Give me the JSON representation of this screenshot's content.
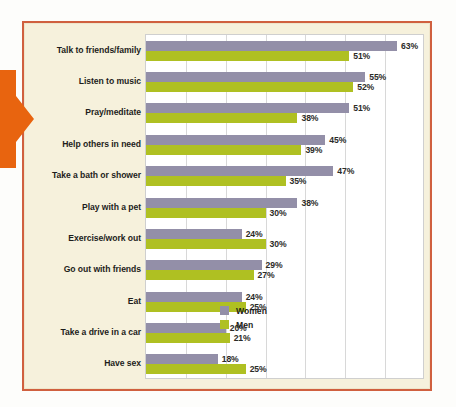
{
  "colors": {
    "women": "#938fa8",
    "men": "#afc022",
    "frame_border": "#d0603f",
    "card_background": "#f6f1dc",
    "plot_background": "#ffffff",
    "gridline": "#d8d8d8",
    "arrow": "#e8640f",
    "label_text": "#1d1d1b"
  },
  "legend": {
    "items": [
      {
        "label": "Women",
        "color": "#938fa8"
      },
      {
        "label": "Men",
        "color": "#afc022"
      }
    ]
  },
  "chart_data": {
    "type": "bar",
    "orientation": "horizontal",
    "title": "",
    "xlabel": "",
    "ylabel": "",
    "xlim": [
      0,
      70
    ],
    "xticks": [
      0,
      10,
      20,
      30,
      40,
      50,
      60,
      70
    ],
    "grid": true,
    "legend_position": "inside-right-lower",
    "value_suffix": "%",
    "categories": [
      "Talk to friends/family",
      "Listen to music",
      "Pray/meditate",
      "Help others in need",
      "Take a bath or shower",
      "Play with a pet",
      "Exercise/work out",
      "Go out with friends",
      "Eat",
      "Take a drive in a car",
      "Have sex"
    ],
    "series": [
      {
        "name": "Women",
        "color": "#938fa8",
        "values": [
          63,
          55,
          51,
          45,
          47,
          38,
          24,
          29,
          24,
          20,
          18
        ],
        "labels": [
          "63%",
          "55%",
          "51%",
          "45%",
          "47%",
          "38%",
          "24%",
          "29%",
          "24%",
          "20%",
          "18%"
        ]
      },
      {
        "name": "Men",
        "color": "#afc022",
        "values": [
          51,
          52,
          38,
          39,
          35,
          30,
          30,
          27,
          25,
          21,
          25
        ],
        "labels": [
          "51%",
          "52%",
          "38%",
          "39%",
          "35%",
          "30%",
          "30%",
          "27%",
          "25%",
          "21%",
          "25%"
        ]
      }
    ]
  }
}
